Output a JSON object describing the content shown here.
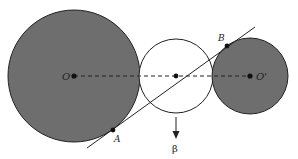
{
  "diagram": {
    "labels": {
      "O": "O",
      "O_prime": "O'",
      "A": "A",
      "B": "B",
      "beta": "β"
    },
    "colors": {
      "shaded": "#6e6e6e",
      "stroke": "#222222",
      "background": "#ffffff"
    },
    "circles": [
      {
        "name": "large-circle",
        "cx": 74,
        "cy": 76,
        "r": 66,
        "fill": "shaded"
      },
      {
        "name": "middle-circle",
        "cx": 176,
        "cy": 76,
        "r": 37,
        "fill": "white"
      },
      {
        "name": "right-circle",
        "cx": 250,
        "cy": 76,
        "r": 38,
        "fill": "shaded"
      }
    ]
  }
}
